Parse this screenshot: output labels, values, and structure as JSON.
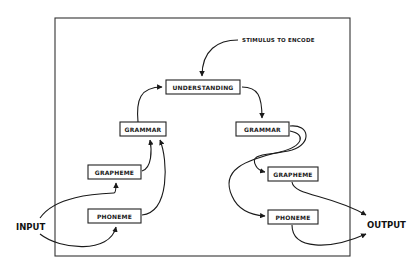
{
  "diagram": {
    "stimulus_label": "STIMULUS TO ENCODE",
    "input_label": "INPUT",
    "output_label": "OUTPUT",
    "nodes": {
      "understanding": "UNDERSTANDING",
      "grammar_left": "GRAMMAR",
      "grammar_right": "GRAMMAR",
      "grapheme_left": "GRAPHEME",
      "phoneme_left": "PHONEME",
      "grapheme_right": "GRAPHEME",
      "phoneme_right": "PHONEME"
    },
    "edges": [
      {
        "from": "STIMULUS TO ENCODE",
        "to": "UNDERSTANDING"
      },
      {
        "from": "INPUT",
        "to": "GRAPHEME (left)"
      },
      {
        "from": "INPUT",
        "to": "PHONEME (left)"
      },
      {
        "from": "GRAPHEME (left)",
        "to": "GRAMMAR (left)"
      },
      {
        "from": "PHONEME (left)",
        "to": "GRAMMAR (left)"
      },
      {
        "from": "GRAMMAR (left)",
        "to": "UNDERSTANDING"
      },
      {
        "from": "UNDERSTANDING",
        "to": "GRAMMAR (right)"
      },
      {
        "from": "GRAMMAR (right)",
        "to": "GRAPHEME (right)"
      },
      {
        "from": "GRAMMAR (right)",
        "to": "PHONEME (right)"
      },
      {
        "from": "GRAPHEME (right)",
        "to": "OUTPUT"
      },
      {
        "from": "PHONEME (right)",
        "to": "OUTPUT"
      }
    ]
  }
}
